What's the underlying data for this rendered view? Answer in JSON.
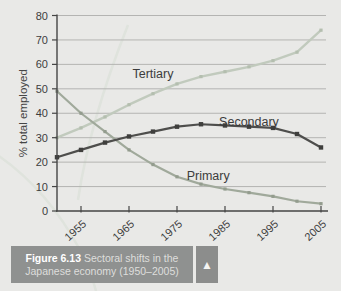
{
  "page": {
    "background": "#e9e9e7"
  },
  "chart_data": {
    "type": "line",
    "title": "",
    "xlabel": "",
    "ylabel": "% total employed",
    "x": [
      1950,
      1955,
      1960,
      1965,
      1970,
      1975,
      1980,
      1985,
      1990,
      1995,
      2000,
      2005
    ],
    "x_tick_years": [
      1955,
      1965,
      1975,
      1985,
      1995,
      2005
    ],
    "x_tick_labels": [
      "1955",
      "1965",
      "1975",
      "1985",
      "1995",
      "2005"
    ],
    "ylim": [
      0,
      80
    ],
    "y_ticks": [
      0,
      10,
      20,
      30,
      40,
      50,
      60,
      70,
      80
    ],
    "grid": "horizontal",
    "legend_position": "inline-labels",
    "series": [
      {
        "name": "Tertiary",
        "color": "#c1cabd",
        "marker_color": "#b4beaf",
        "values": [
          30,
          34,
          38.5,
          43.5,
          48,
          52,
          55,
          57,
          59,
          61.5,
          65,
          74
        ],
        "label_pos": {
          "year": 1970,
          "value": 56
        }
      },
      {
        "name": "Secondary",
        "color": "#4e4e4c",
        "marker_color": "#3f3f3d",
        "values": [
          22,
          25,
          28,
          30.5,
          32.5,
          34.5,
          35.5,
          35,
          34.5,
          34,
          31.5,
          26
        ],
        "label_pos": {
          "year": 1990,
          "value": 36.5
        }
      },
      {
        "name": "Primary",
        "color": "#a0a99b",
        "marker_color": "#939c8e",
        "values": [
          49,
          40,
          32.5,
          25,
          19,
          14,
          11,
          9,
          7.5,
          6,
          4,
          3
        ],
        "label_pos": {
          "year": 1981.5,
          "value": 14.5
        }
      }
    ],
    "colors": {
      "gridline": "#b4b4b2",
      "axis": "#454545",
      "tick_text": "#3d3d3d",
      "series_label_text": "#3c3c3c",
      "decor_curve": "#dfe3dc"
    }
  },
  "caption": {
    "figure_label": "Figure 6.13",
    "line1_rest": " Sectoral shifts in the",
    "line2": "Japanese economy (1950–2005)",
    "arrow_icon": "▲"
  }
}
